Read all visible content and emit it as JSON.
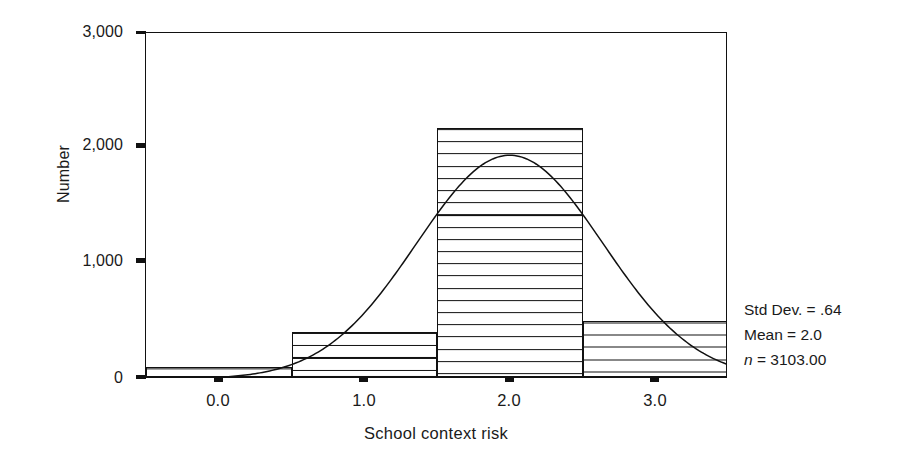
{
  "chart_data": {
    "type": "bar",
    "title": "",
    "subtitle": "",
    "xlabel": "School context risk",
    "ylabel": "Number",
    "xlim": [
      -0.5,
      3.5
    ],
    "ylim": [
      0,
      3000
    ],
    "grid": false,
    "legend": "none",
    "x_tick_labels": [
      "0.0",
      "1.0",
      "2.0",
      "3.0"
    ],
    "x_tick_values": [
      0.0,
      1.0,
      2.0,
      3.0
    ],
    "y_tick_labels": [
      "0",
      "1,000",
      "2,000",
      "3,000"
    ],
    "y_tick_values": [
      0,
      1000,
      2000,
      3000
    ],
    "bin_width": 1.0,
    "categories": [
      "0.0",
      "1.0",
      "2.0",
      "3.0"
    ],
    "bin_edges": [
      -0.5,
      0.5,
      1.5,
      2.5,
      3.5
    ],
    "bin_centers": [
      0.0,
      1.0,
      2.0,
      3.0
    ],
    "values": [
      90,
      390,
      2160,
      490
    ],
    "bar_fill": "horizontal-hatch",
    "overlay": {
      "type": "normal-curve",
      "mean": 2.0,
      "std_dev": 0.64,
      "n": 3103,
      "peak_value": 1940
    },
    "annotations": {
      "std_dev_label": "Std Dev. = .64",
      "mean_label": "Mean = 2.0",
      "n_symbol": "n",
      "n_value": " = 3103.00"
    }
  },
  "colors": {
    "axis": "#111111",
    "bar_outline": "#111111",
    "hatch": "#111111",
    "curve": "#111111",
    "background": "#ffffff",
    "text": "#1a1a1a"
  }
}
